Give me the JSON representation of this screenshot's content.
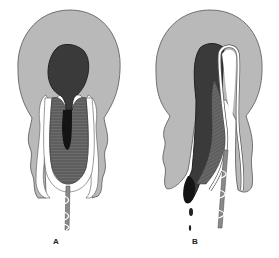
{
  "diagram": {
    "panels": [
      {
        "id": "A",
        "label": "A"
      },
      {
        "id": "B",
        "label": "B"
      }
    ],
    "colors": {
      "background": "#ffffff",
      "outer_tissue": "#b9b9b9",
      "outline": "#555555",
      "dark_mass": "#3a3a3a",
      "darkest": "#141414",
      "striated": "#6b6b6b",
      "white_layer": "#ffffff",
      "stalk": "#8a8a8a"
    }
  }
}
